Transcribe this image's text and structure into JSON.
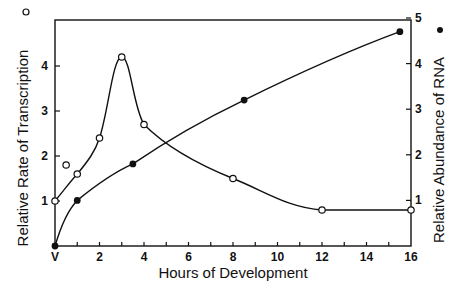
{
  "chart_data": {
    "type": "line",
    "title": "",
    "xlabel": "Hours of Development",
    "ylabel_left": "Relative Rate of Transcription",
    "ylabel_left_marker": "open-circle",
    "ylabel_right": "Relative Abundance of RNA",
    "ylabel_right_marker": "filled-circle",
    "x_ticks": [
      "V",
      "2",
      "4",
      "6",
      "8",
      "10",
      "12",
      "14",
      "16"
    ],
    "x_range": [
      0,
      16
    ],
    "y_left_ticks": [
      "1",
      "2",
      "3",
      "4"
    ],
    "y_left_range": [
      0,
      5
    ],
    "y_right_ticks": [
      "1",
      "2",
      "3",
      "4",
      "5"
    ],
    "y_right_range": [
      0,
      5
    ],
    "grid": false,
    "series": [
      {
        "name": "Relative Rate of Transcription",
        "axis": "left",
        "marker": "open-circle",
        "x": [
          0,
          1,
          2,
          3,
          4,
          8,
          12,
          16
        ],
        "y": [
          1.0,
          1.6,
          2.4,
          4.2,
          2.7,
          1.5,
          0.8,
          0.8
        ],
        "extra_points": [
          {
            "x": 0.5,
            "y": 1.8
          }
        ]
      },
      {
        "name": "Relative Abundance of RNA",
        "axis": "right",
        "marker": "filled-circle",
        "x": [
          0,
          1,
          3.5,
          8.5,
          15.5
        ],
        "y": [
          0,
          1.0,
          1.8,
          3.2,
          4.7
        ]
      }
    ]
  }
}
